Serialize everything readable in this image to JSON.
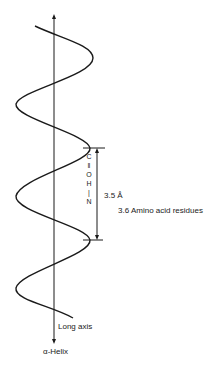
{
  "figure": {
    "title": "α-Helix",
    "axis_label": "Long axis",
    "pitch_label": "3.5 Å",
    "residues_label": "3.6 Amino acid residues",
    "hbond_atoms": [
      "C",
      "‖",
      "O",
      "H",
      "|",
      "N"
    ],
    "colors": {
      "stroke": "#1a1a1a",
      "background": "#ffffff"
    }
  }
}
